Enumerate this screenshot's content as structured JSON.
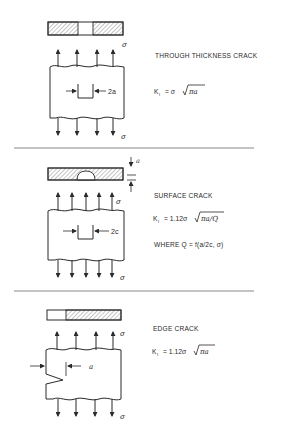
{
  "figure": {
    "panels": [
      {
        "id": "through-thickness",
        "title": "THROUGH THICKNESS CRACK",
        "equation": "K₁ = σ √πa",
        "eq_parts": {
          "k": "K",
          "sub": "I",
          "rhs_prefix": "= σ",
          "radicand": "πa"
        },
        "dimension_label": "2a",
        "stress_top": "σ",
        "stress_bottom": "σ"
      },
      {
        "id": "surface",
        "title": "SURFACE CRACK",
        "equation": "K₁ = 1.12σ √πa/Q",
        "eq_parts": {
          "k": "K",
          "sub": "I",
          "rhs_prefix": "= 1.12σ",
          "radicand": "πa/Q"
        },
        "note": "WHERE  Q = f(a/2c, σ)",
        "dimension_label": "2c",
        "depth_label": "a",
        "stress_top": "σ",
        "stress_bottom": "σ"
      },
      {
        "id": "edge",
        "title": "EDGE CRACK",
        "equation": "K₁ = 1.12σ √πa",
        "eq_parts": {
          "k": "K",
          "sub": "I",
          "rhs_prefix": "= 1.12σ",
          "radicand": "πa"
        },
        "dimension_label": "a",
        "stress_top": "σ",
        "stress_bottom": "σ"
      }
    ]
  },
  "colors": {
    "ink": "#2a2a2a",
    "divider": "#8a8a8a",
    "background": "#ffffff"
  }
}
